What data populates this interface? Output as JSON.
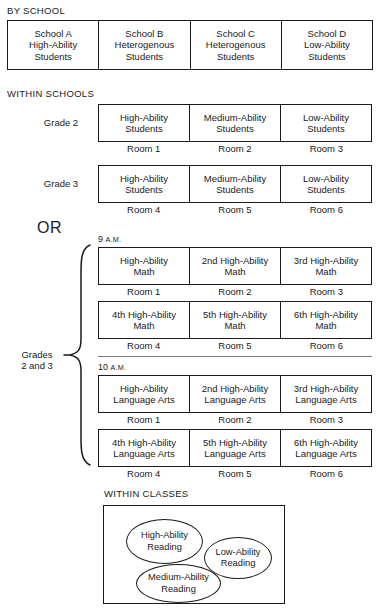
{
  "diagram": {
    "title_hidden": "Ability grouping arrangements",
    "sections": {
      "by_school": {
        "caption": "BY SCHOOL",
        "cells": [
          {
            "lines": [
              "School A",
              "High-Ability",
              "Students"
            ]
          },
          {
            "lines": [
              "School B",
              "Heterogenous",
              "Students"
            ]
          },
          {
            "lines": [
              "School C",
              "Heterogenous",
              "Students"
            ]
          },
          {
            "lines": [
              "School D",
              "Low-Ability",
              "Students"
            ]
          }
        ]
      },
      "within_schools": {
        "caption": "WITHIN SCHOOLS",
        "rows": [
          {
            "label": "Grade 2",
            "cells": [
              {
                "lines": [
                  "High-Ability",
                  "Students"
                ]
              },
              {
                "lines": [
                  "Medium-Ability",
                  "Students"
                ]
              },
              {
                "lines": [
                  "Low-Ability",
                  "Students"
                ]
              }
            ],
            "rooms": [
              "Room 1",
              "Room 2",
              "Room 3"
            ]
          },
          {
            "label": "Grade 3",
            "cells": [
              {
                "lines": [
                  "High-Ability",
                  "Students"
                ]
              },
              {
                "lines": [
                  "Medium-Ability",
                  "Students"
                ]
              },
              {
                "lines": [
                  "Low-Ability",
                  "Students"
                ]
              }
            ],
            "rooms": [
              "Room 4",
              "Room 5",
              "Room 6"
            ]
          }
        ]
      },
      "or": {
        "label": "OR"
      },
      "regrouping": {
        "side_label_line1": "Grades",
        "side_label_line2": "2 and 3",
        "blocks": [
          {
            "time_number": "9",
            "time_suffix": "A.M.",
            "rows": [
              {
                "cells": [
                  {
                    "lines": [
                      "High-Ability",
                      "Math"
                    ]
                  },
                  {
                    "lines": [
                      "2nd High-Ability",
                      "Math"
                    ]
                  },
                  {
                    "lines": [
                      "3rd High-Ability",
                      "Math"
                    ]
                  }
                ],
                "rooms": [
                  "Room 1",
                  "Room 2",
                  "Room 3"
                ]
              },
              {
                "cells": [
                  {
                    "lines": [
                      "4th High-Ability",
                      "Math"
                    ]
                  },
                  {
                    "lines": [
                      "5th High-Ability",
                      "Math"
                    ]
                  },
                  {
                    "lines": [
                      "6th High-Ability",
                      "Math"
                    ]
                  }
                ],
                "rooms": [
                  "Room 4",
                  "Room 5",
                  "Room 6"
                ]
              }
            ]
          },
          {
            "time_number": "10",
            "time_suffix": "A.M.",
            "rows": [
              {
                "cells": [
                  {
                    "lines": [
                      "High-Ability",
                      "Language Arts"
                    ]
                  },
                  {
                    "lines": [
                      "2nd High-Ability",
                      "Language Arts"
                    ]
                  },
                  {
                    "lines": [
                      "3rd High-Ability",
                      "Language Arts"
                    ]
                  }
                ],
                "rooms": [
                  "Room 1",
                  "Room 2",
                  "Room 3"
                ]
              },
              {
                "cells": [
                  {
                    "lines": [
                      "4th High-Ability",
                      "Language Arts"
                    ]
                  },
                  {
                    "lines": [
                      "5th High-Ability",
                      "Language Arts"
                    ]
                  },
                  {
                    "lines": [
                      "6th High-Ability",
                      "Language Arts"
                    ]
                  }
                ],
                "rooms": [
                  "Room 4",
                  "Room 5",
                  "Room 6"
                ]
              }
            ]
          }
        ]
      },
      "within_classes": {
        "caption": "WITHIN CLASSES",
        "groups": [
          {
            "lines": [
              "High-Ability",
              "Reading"
            ]
          },
          {
            "lines": [
              "Low-Ability",
              "Reading"
            ]
          },
          {
            "lines": [
              "Medium-Ability",
              "Reading"
            ]
          }
        ]
      }
    },
    "colors": {
      "ink": "#1a1a1a",
      "divider": "#7a7a7a",
      "background": "#ffffff"
    }
  }
}
